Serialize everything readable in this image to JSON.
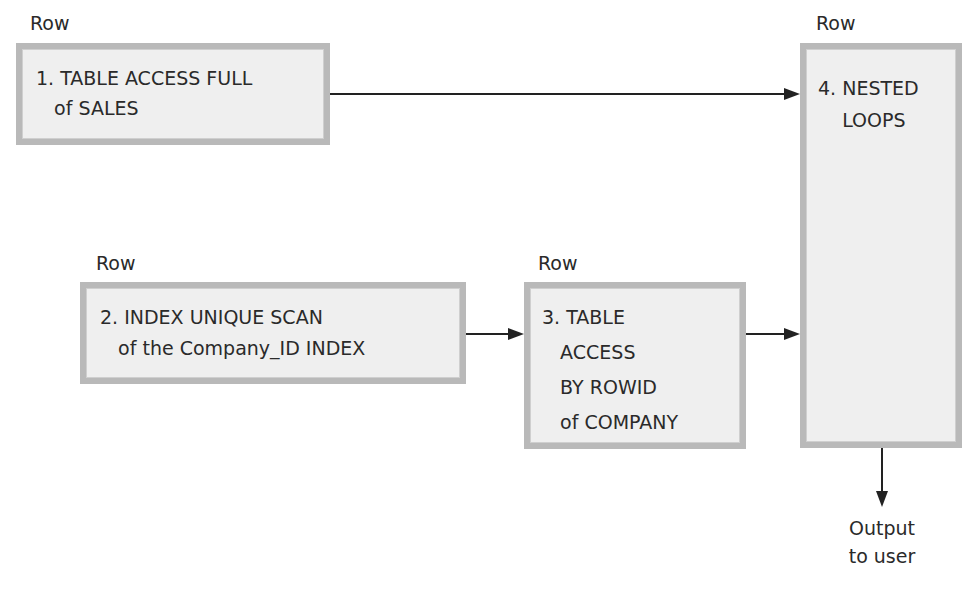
{
  "diagram": {
    "nodes": [
      {
        "id": 1,
        "row_label": "Row",
        "lines": [
          "1. TABLE ACCESS FULL",
          "   of SALES"
        ]
      },
      {
        "id": 2,
        "row_label": "Row",
        "lines": [
          "2. INDEX UNIQUE SCAN",
          "   of the Company_ID INDEX"
        ]
      },
      {
        "id": 3,
        "row_label": "Row",
        "lines": [
          "3. TABLE",
          "   ACCESS",
          "   BY ROWID",
          "   of COMPANY"
        ]
      },
      {
        "id": 4,
        "row_label": "Row",
        "lines": [
          "4. NESTED",
          "    LOOPS"
        ]
      }
    ],
    "edges": [
      {
        "from": 1,
        "to": 4
      },
      {
        "from": 2,
        "to": 3
      },
      {
        "from": 3,
        "to": 4
      },
      {
        "from": 4,
        "to": "output"
      }
    ],
    "output": {
      "line1": "Output",
      "line2": "to user"
    },
    "colors": {
      "box_fill": "#efefef",
      "box_border": "#b9b9b9",
      "arrow": "#222222"
    }
  }
}
